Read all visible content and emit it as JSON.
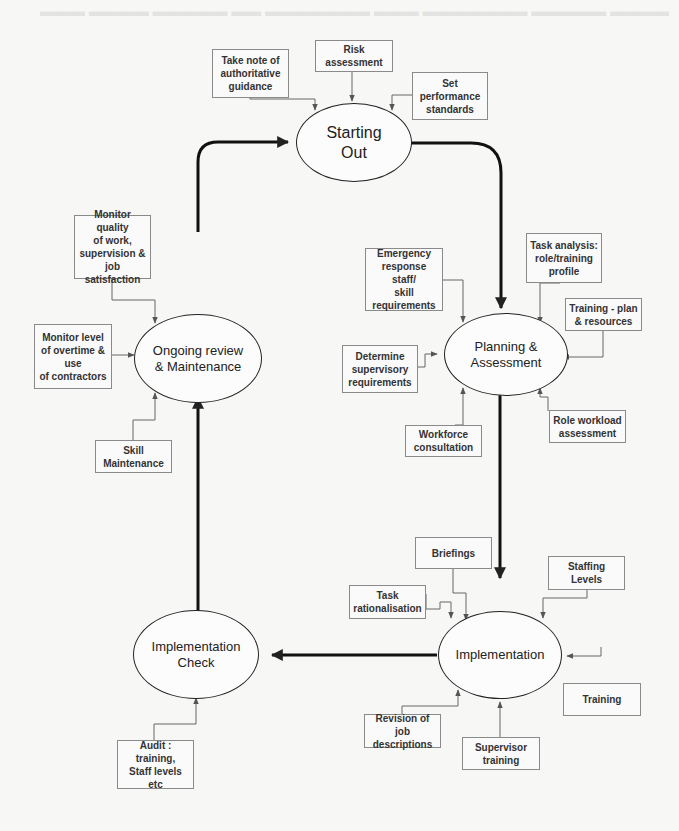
{
  "diagram": {
    "type": "process-cycle",
    "stages": [
      {
        "id": "starting_out",
        "label": "Starting\nOut"
      },
      {
        "id": "planning",
        "label": "Planning &\nAssessment"
      },
      {
        "id": "implementation",
        "label": "Implementation"
      },
      {
        "id": "impl_check",
        "label": "Implementation\nCheck"
      },
      {
        "id": "ongoing",
        "label": "Ongoing review\n& Maintenance"
      }
    ],
    "inputs": {
      "starting_out": [
        "Take note of\nauthoritative\nguidance",
        "Risk\nassessment",
        "Set\nperformance\nstandards"
      ],
      "planning": [
        "Emergency\nresponse staff/\nskill\nrequirements",
        "Task analysis:\nrole/training\nprofile",
        "Training - plan\n& resources",
        "Determine\nsupervisory\nrequirements",
        "Workforce\nconsultation",
        "Role workload\nassessment"
      ],
      "implementation": [
        "Briefings",
        "Task\nrationalisation",
        "Staffing Levels",
        "Training",
        "Revision of job\ndescriptions",
        "Supervisor\ntraining"
      ],
      "impl_check": [
        "Audit :\ntraining,\nStaff levels etc"
      ],
      "ongoing": [
        "Monitor quality\nof work,\nsupervision &\njob satisfaction",
        "Monitor level\nof overtime &\nuse\nof contractors",
        "Skill\nMaintenance"
      ]
    },
    "flow": [
      "Starting Out -> Planning & Assessment",
      "Planning & Assessment -> Implementation",
      "Implementation -> Implementation Check",
      "Implementation Check -> Ongoing review & Maintenance",
      "Ongoing review & Maintenance -> Starting Out"
    ]
  }
}
